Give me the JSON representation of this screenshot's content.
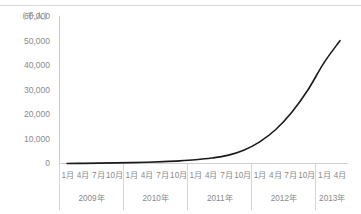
{
  "chart_data": {
    "type": "line",
    "title": "",
    "subtitle": "",
    "unit_label": "（千人）",
    "xlabel": "",
    "ylabel": "",
    "ylim": [
      0,
      60000
    ],
    "yticks": [
      "60,000",
      "50,000",
      "40,000",
      "30,000",
      "20,000",
      "10,000",
      "0"
    ],
    "ytick_values": [
      60000,
      50000,
      40000,
      30000,
      20000,
      10000,
      0
    ],
    "grid": false,
    "legend": "none",
    "line_color": "#1a1a1a",
    "axis_color": "#cfcfcf",
    "tick_text_color": "#8a8a8a",
    "x_groups": [
      {
        "year": "2009年",
        "months": [
          "1月",
          "4月",
          "7月",
          "10月"
        ]
      },
      {
        "year": "2010年",
        "months": [
          "1月",
          "4月",
          "7月",
          "10月"
        ]
      },
      {
        "year": "2011年",
        "months": [
          "1月",
          "4月",
          "7月",
          "10月"
        ]
      },
      {
        "year": "2012年",
        "months": [
          "1月",
          "4月",
          "7月",
          "10月"
        ]
      },
      {
        "year": "2013年",
        "months": [
          "1月",
          "4月"
        ]
      }
    ],
    "x": [
      "2009-01",
      "2009-04",
      "2009-07",
      "2009-10",
      "2010-01",
      "2010-04",
      "2010-07",
      "2010-10",
      "2011-01",
      "2011-04",
      "2011-07",
      "2011-10",
      "2012-01",
      "2012-04",
      "2012-07",
      "2012-10",
      "2013-01",
      "2013-04"
    ],
    "values": [
      200,
      260,
      340,
      440,
      560,
      720,
      950,
      1250,
      1700,
      2400,
      3500,
      5600,
      9000,
      14000,
      21000,
      30000,
      41000,
      50000
    ]
  }
}
